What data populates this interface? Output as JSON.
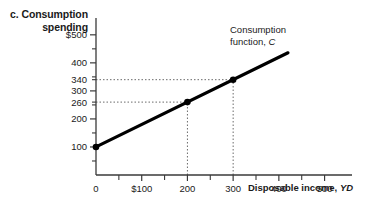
{
  "figure": {
    "panel_letter": "c.",
    "panel_title_line1": "Consumption",
    "panel_title_line2": "spending"
  },
  "chart_data": {
    "type": "line",
    "title": "Consumption spending",
    "xlabel": "Disposable income, YD",
    "ylabel": "Consumption spending",
    "xlim": [
      0,
      560
    ],
    "ylim": [
      0,
      560
    ],
    "grid": false,
    "legend": false,
    "x_ticks_major": [
      0,
      100,
      200,
      300,
      400,
      500
    ],
    "x_tick_labels": [
      "0",
      "$100",
      "200",
      "300",
      "400",
      "500"
    ],
    "x_ticks_minor": [
      50,
      150,
      250,
      350,
      450
    ],
    "y_ticks_major": [
      100,
      200,
      300,
      400,
      500
    ],
    "y_tick_labels": [
      "100",
      "200",
      "300",
      "400",
      "$500"
    ],
    "y_ticks_minor": [
      50,
      150,
      250,
      350,
      450
    ],
    "y_ticks_extra": [
      260,
      340
    ],
    "y_tick_extra_labels": [
      "260",
      "340"
    ],
    "series": [
      {
        "name": "Consumption function, C",
        "x": [
          0,
          420
        ],
        "y": [
          100,
          436
        ],
        "intercept": 100,
        "slope": 0.8,
        "color": "#000000"
      }
    ],
    "points": [
      {
        "x": 200,
        "y": 260
      },
      {
        "x": 300,
        "y": 340
      },
      {
        "x": 0,
        "y": 100
      }
    ],
    "guide_lines": [
      {
        "from_x": 0,
        "to_x": 200,
        "y": 260
      },
      {
        "from_x": 0,
        "to_x": 300,
        "y": 340
      },
      {
        "x": 200,
        "from_y": 0,
        "to_y": 260
      },
      {
        "x": 300,
        "from_y": 0,
        "to_y": 340
      }
    ],
    "annotations": [
      {
        "text_line1": "Consumption",
        "text_line2_plain": "function, ",
        "text_line2_italic": "C",
        "x": 330,
        "y": 480
      }
    ],
    "axis_label_x_plain": "Disposable income, ",
    "axis_label_x_italic": "YD",
    "axis_color": "#3a3a3a",
    "line_color": "#000000",
    "guide_color": "#6a6a6a"
  }
}
